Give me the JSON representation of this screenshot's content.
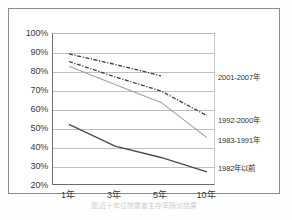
{
  "figure": {
    "caption": "图 近十年住院患者生存率随访结果"
  },
  "chart_data": {
    "type": "line",
    "title": "",
    "xlabel": "",
    "ylabel": "",
    "x": [
      "1年",
      "3年",
      "5年",
      "10年"
    ],
    "categories": [
      "1年",
      "3年",
      "5年",
      "10年"
    ],
    "ylim": [
      20,
      100
    ],
    "yticks": [
      "20%",
      "30%",
      "40%",
      "50%",
      "60%",
      "70%",
      "80%",
      "90%",
      "100%"
    ],
    "ytick_values": [
      20,
      30,
      40,
      50,
      60,
      70,
      80,
      90,
      100
    ],
    "grid": true,
    "legend_position": "right",
    "series": [
      {
        "name": "2001-2007年",
        "style": "dash-dot",
        "color": "#3c3c3c",
        "values": [
          89.5,
          84.0,
          78.0,
          null
        ]
      },
      {
        "name": "1992-2000年",
        "style": "dash-dot",
        "color": "#3c3c3c",
        "values": [
          85.5,
          77.5,
          70.0,
          57.0
        ]
      },
      {
        "name": "1983-1991年",
        "style": "solid",
        "color": "#a0a0a0",
        "values": [
          83.0,
          73.5,
          64.0,
          45.5
        ]
      },
      {
        "name": "1982年以前",
        "style": "solid",
        "color": "#4a4a4a",
        "values": [
          52.5,
          41.0,
          35.0,
          27.5
        ]
      }
    ]
  },
  "legend": {
    "items": [
      {
        "label": "2001-2007年",
        "top": 40
      },
      {
        "label": "1992-2000年",
        "top": 83
      },
      {
        "label": "1983-1991年",
        "top": 103
      },
      {
        "label": "1982年以前",
        "top": 131
      }
    ]
  },
  "colors": {
    "frame": "#8d8d8d",
    "grid": "#bfbfbf",
    "axis": "#6e6e6e",
    "series_dark": "#3c3c3c",
    "series_gray": "#a0a0a0",
    "series_bottom": "#4a4a4a",
    "text": "#3a3a3a"
  }
}
